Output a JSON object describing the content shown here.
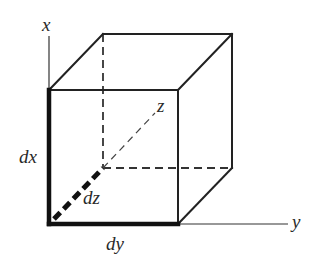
{
  "diagram": {
    "labels": {
      "x_axis": "x",
      "y_axis": "y",
      "z_axis": "z",
      "dx": "dx",
      "dy": "dy",
      "dz": "dz"
    },
    "colors": {
      "background": "#ffffff",
      "line": "#222222",
      "highlight_edges": "#111111"
    },
    "geometry": {
      "front_face": {
        "top_left": [
          49,
          90
        ],
        "top_right": [
          178,
          90
        ],
        "bottom_right": [
          178,
          224
        ],
        "bottom_left": [
          49,
          224
        ]
      },
      "back_face": {
        "top_left": [
          103,
          34
        ],
        "top_right": [
          232,
          34
        ],
        "bottom_right": [
          232,
          168
        ],
        "bottom_left": [
          103,
          168
        ]
      },
      "x_axis_top": [
        49,
        36
      ],
      "y_axis_end": [
        288,
        224
      ],
      "z_axis_end": [
        155,
        113
      ]
    }
  }
}
